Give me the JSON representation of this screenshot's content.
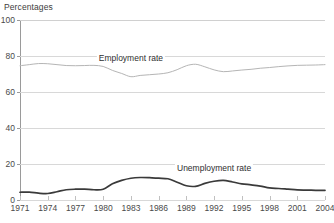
{
  "chart_data": {
    "type": "line",
    "title": "Percentages",
    "xlabel": "",
    "ylabel": "Percentages",
    "xlim": [
      1971,
      2004
    ],
    "ylim": [
      0,
      100
    ],
    "grid": true,
    "legend_position": "inline-annotation",
    "y_ticks": [
      0,
      20,
      40,
      60,
      80,
      100
    ],
    "x_ticks": [
      1971,
      1974,
      1977,
      1980,
      1983,
      1986,
      1989,
      1992,
      1995,
      1998,
      2001,
      2004
    ],
    "x": [
      1971,
      1972,
      1973,
      1974,
      1975,
      1976,
      1977,
      1978,
      1979,
      1980,
      1981,
      1982,
      1983,
      1984,
      1985,
      1986,
      1987,
      1988,
      1989,
      1990,
      1991,
      1992,
      1993,
      1994,
      1995,
      1996,
      1997,
      1998,
      1999,
      2000,
      2001,
      2002,
      2003,
      2004
    ],
    "series": [
      {
        "name": "Employment rate",
        "color": "#b5b5b5",
        "label_x": 1983,
        "label_y": 79,
        "values": [
          74.6,
          75.2,
          75.8,
          75.7,
          75.2,
          74.7,
          74.6,
          74.7,
          74.8,
          74.2,
          72.0,
          70.3,
          68.5,
          69.2,
          69.6,
          70.0,
          70.7,
          72.4,
          74.6,
          75.4,
          74.0,
          72.3,
          71.3,
          71.7,
          72.2,
          72.6,
          73.2,
          73.6,
          74.1,
          74.5,
          74.8,
          74.9,
          75.0,
          75.2
        ]
      },
      {
        "name": "Unemployment rate",
        "color": "#3a3a3a",
        "label_x": 1992,
        "label_y": 18,
        "values": [
          4.3,
          4.4,
          3.8,
          3.6,
          4.6,
          5.7,
          6.0,
          6.0,
          5.7,
          6.0,
          9.0,
          10.9,
          12.1,
          12.5,
          12.4,
          12.1,
          11.8,
          9.9,
          7.9,
          7.6,
          9.2,
          10.4,
          10.9,
          10.0,
          9.0,
          8.4,
          7.7,
          6.7,
          6.4,
          6.0,
          5.6,
          5.5,
          5.4,
          5.3
        ]
      }
    ]
  }
}
